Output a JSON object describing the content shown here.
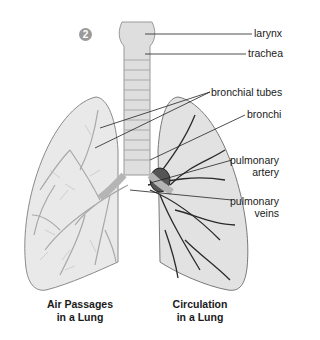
{
  "figure": {
    "step_number": "2",
    "labels": {
      "larynx": "larynx",
      "trachea": "trachea",
      "bronchial_tubes": "bronchial tubes",
      "bronchi": "bronchi",
      "pulmonary_artery_1": "pulmonary",
      "pulmonary_artery_2": "artery",
      "pulmonary_veins_1": "pulmonary",
      "pulmonary_veins_2": "veins"
    },
    "captions": {
      "left_1": "Air Passages",
      "left_2": "in a Lung",
      "right_1": "Circulation",
      "right_2": "in a Lung"
    },
    "colors": {
      "lung_fill": "#e6e6e6",
      "lung_outline": "#8a8a8a",
      "airway": "#b5b5b5",
      "vessel": "#2a2a2a",
      "leader_line": "#222222",
      "badge": "#9a9a9a"
    }
  }
}
